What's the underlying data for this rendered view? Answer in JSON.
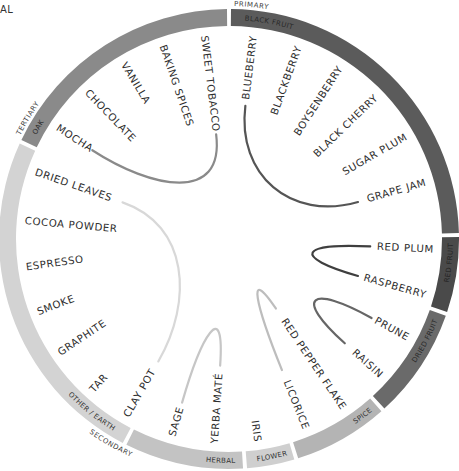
{
  "corner_text": "AL",
  "tiers": {
    "primary": "PRIMARY",
    "secondary": "SECONDARY",
    "tertiary": "TERTIARY"
  },
  "segments": [
    {
      "key": "black_fruit",
      "label": "BLACK FRUIT",
      "tier": "primary",
      "start": 0,
      "end": 89,
      "color": "#5b5b5b",
      "text_color": "#2a2a2a"
    },
    {
      "key": "red_fruit",
      "label": "RED FRUIT",
      "tier": "primary",
      "start": 89,
      "end": 109,
      "color": "#4a4a4a",
      "text_color": "#222222"
    },
    {
      "key": "dried_fruit",
      "label": "DRIED FRUIT",
      "tier": "primary",
      "start": 109,
      "end": 138,
      "color": "#6a6a6a",
      "text_color": "#2a2a2a"
    },
    {
      "key": "spice",
      "label": "SPICE",
      "tier": "secondary",
      "start": 138,
      "end": 163,
      "color": "#b4b4b4",
      "text_color": "#333333"
    },
    {
      "key": "flower",
      "label": "FLOWER",
      "tier": "secondary",
      "start": 163,
      "end": 176,
      "color": "#cfcfcf",
      "text_color": "#333333"
    },
    {
      "key": "herbal",
      "label": "HERBAL",
      "tier": "secondary",
      "start": 176,
      "end": 207,
      "color": "#c3c3c3",
      "text_color": "#333333"
    },
    {
      "key": "other_earth",
      "label": "OTHER / EARTH",
      "tier": "secondary",
      "start": 207,
      "end": 295,
      "color": "#d3d3d3",
      "text_color": "#333333"
    },
    {
      "key": "oak",
      "label": "OAK",
      "tier": "tertiary",
      "start": 295,
      "end": 360,
      "color": "#8a8a8a",
      "text_color": "#2a2a2a"
    }
  ],
  "descriptors": [
    {
      "label": "BLUEBERRY",
      "angle": 7
    },
    {
      "label": "BLACKBERRY",
      "angle": 20
    },
    {
      "label": "BOYSENBERRY",
      "angle": 33
    },
    {
      "label": "BLACK CHERRY",
      "angle": 46
    },
    {
      "label": "SUGAR PLUM",
      "angle": 60
    },
    {
      "label": "GRAPE JAM",
      "angle": 74
    },
    {
      "label": "RED PLUM",
      "angle": 93
    },
    {
      "label": "RASPBERRY",
      "angle": 106
    },
    {
      "label": "PRUNE",
      "angle": 119
    },
    {
      "label": "RAISIN",
      "angle": 132
    },
    {
      "label": "RED PEPPER FLAKE",
      "angle": 146
    },
    {
      "label": "LICORICE",
      "angle": 158
    },
    {
      "label": "IRIS",
      "angle": 172
    },
    {
      "label": "YERBA MATÉ",
      "angle": 184
    },
    {
      "label": "SAGE",
      "angle": 196
    },
    {
      "label": "CLAY POT",
      "angle": 210
    },
    {
      "label": "TAR",
      "angle": 222
    },
    {
      "label": "GRAPHITE",
      "angle": 236
    },
    {
      "label": "SMOKE",
      "angle": 249
    },
    {
      "label": "ESPRESSO",
      "angle": 262
    },
    {
      "label": "COCOA POWDER",
      "angle": 275
    },
    {
      "label": "DRIED LEAVES",
      "angle": 289
    },
    {
      "label": "MOCHA",
      "angle": 303
    },
    {
      "label": "CHOCOLATE",
      "angle": 316
    },
    {
      "label": "VANILLA",
      "angle": 329
    },
    {
      "label": "BAKING SPICES",
      "angle": 341
    },
    {
      "label": "SWEET TOBACCO",
      "angle": 353
    }
  ],
  "links": [
    {
      "from": "BLUEBERRY",
      "to": "GRAPE JAM",
      "color": "#555555"
    },
    {
      "from": "RED PLUM",
      "to": "RASPBERRY",
      "color": "#3f3f3f"
    },
    {
      "from": "PRUNE",
      "to": "RAISIN",
      "color": "#666666"
    },
    {
      "from": "RED PEPPER FLAKE",
      "to": "LICORICE",
      "color": "#bdbdbd"
    },
    {
      "from": "YERBA MATÉ",
      "to": "SAGE",
      "color": "#c6c6c6"
    },
    {
      "from": "DRIED LEAVES",
      "to": "CLAY POT",
      "color": "#d8d8d8"
    },
    {
      "from": "MOCHA",
      "to": "SWEET TOBACCO",
      "color": "#8a8a8a"
    }
  ]
}
